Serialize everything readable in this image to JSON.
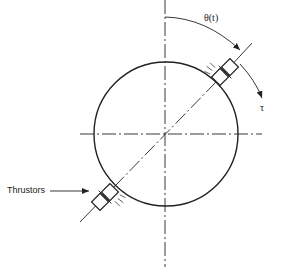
{
  "diagram": {
    "labels": {
      "angle": "θ(t)",
      "torque": "τ",
      "thrusters": "Thrustors"
    },
    "colors": {
      "stroke": "#222222",
      "background": "#ffffff"
    },
    "elements": [
      "spacecraft-circle",
      "vertical-reference-axis",
      "horizontal-reference-axis",
      "body-axis-diagonal",
      "thruster-upper-right",
      "thruster-lower-left",
      "angle-arc-arrow",
      "torque-arc-arrow",
      "thruster-pointer-arrow"
    ]
  }
}
